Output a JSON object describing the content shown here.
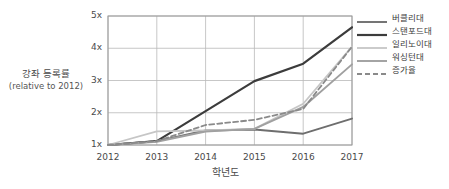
{
  "chart_data": {
    "type": "line",
    "title": "",
    "xlabel": "학년도",
    "ylabel": "강좌 등록률",
    "ylabel_sub": "(relative to 2012)",
    "categories": [
      "2012",
      "2013",
      "2014",
      "2015",
      "2016",
      "2017"
    ],
    "x": [
      2012,
      2013,
      2014,
      2015,
      2016,
      2017
    ],
    "xlim": [
      2012,
      2017
    ],
    "ylim": [
      1,
      5
    ],
    "yticks": [
      1,
      2,
      3,
      4,
      5
    ],
    "ytick_labels": [
      "1x",
      "2x",
      "3x",
      "4x",
      "5x"
    ],
    "grid": true,
    "legend_position": "right",
    "series": [
      {
        "name": "버클리대",
        "values": [
          1.0,
          1.12,
          1.45,
          1.48,
          1.35,
          1.82
        ],
        "color": "#6e6e6e",
        "width": 1.9,
        "dash": ""
      },
      {
        "name": "스탠포드대",
        "values": [
          1.0,
          1.12,
          2.05,
          2.98,
          3.52,
          4.65
        ],
        "color": "#3c3c3c",
        "width": 2.2,
        "dash": ""
      },
      {
        "name": "일리노이대",
        "values": [
          1.0,
          1.42,
          1.45,
          1.5,
          2.28,
          4.05
        ],
        "color": "#c6c6c6",
        "width": 1.8,
        "dash": ""
      },
      {
        "name": "워싱턴대",
        "values": [
          1.0,
          1.1,
          1.42,
          1.5,
          2.18,
          3.5
        ],
        "color": "#a0a0a0",
        "width": 1.9,
        "dash": ""
      },
      {
        "name": "증가율",
        "values": [
          1.0,
          1.12,
          1.62,
          1.78,
          2.12,
          4.05
        ],
        "color": "#8a8a8a",
        "width": 1.8,
        "dash": "5,3"
      }
    ]
  },
  "legend": {
    "items": [
      {
        "label": "버클리대"
      },
      {
        "label": "스탠포드대"
      },
      {
        "label": "일리노이대"
      },
      {
        "label": "워싱턴대"
      },
      {
        "label": "증가율"
      }
    ]
  }
}
